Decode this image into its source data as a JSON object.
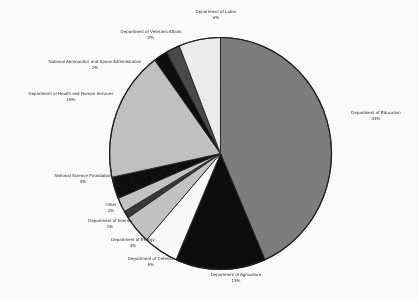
{
  "figure": {
    "kind": "pie-chart",
    "rendering": "grayscale scanned document"
  },
  "chart_data": {
    "type": "pie",
    "title": "",
    "subtitle": "",
    "xlabel": "",
    "ylabel": "",
    "grid": false,
    "legend_position": "none",
    "labels_outside": true,
    "label_format": "name + percent",
    "start_angle_deg": 0,
    "direction": "clockwise",
    "total_percent": 99,
    "categories": [
      "Department of Education",
      "Department of Agriculture",
      "Department of Defense",
      "Department of Energy",
      "Department of Interior",
      "Other",
      "National Science Foundation",
      "Department of Health and Human Services",
      "National Aeronautics and Space Administration",
      "Department of Veterans Affairs",
      "Department of Labor"
    ],
    "values": [
      43,
      13,
      5,
      4,
      1,
      2,
      3,
      18,
      2,
      2,
      6
    ],
    "value_labels": [
      "43%",
      "13%",
      "5%",
      "4%",
      "1%",
      "2%",
      "3%",
      "18%",
      "2%",
      "2%",
      "6%"
    ],
    "slice_colors": [
      "#808080",
      "#101010",
      "#ffffff",
      "#c8c8c8",
      "#3a3a3a",
      "#c8c8c8",
      "#121212",
      "#c6c6c6",
      "#101010",
      "#4a4a4a",
      "#f2f2f2"
    ],
    "slice_border_color": "#222222",
    "slices": [
      {
        "name": "Department of Education",
        "percent": 43,
        "percent_label": "43%",
        "color": "#808080"
      },
      {
        "name": "Department of Agriculture",
        "percent": 13,
        "percent_label": "13%",
        "color": "#101010"
      },
      {
        "name": "Department of Defense",
        "percent": 5,
        "percent_label": "5%",
        "color": "#ffffff"
      },
      {
        "name": "Department of Energy",
        "percent": 4,
        "percent_label": "4%",
        "color": "#c8c8c8"
      },
      {
        "name": "Department of Interior",
        "percent": 1,
        "percent_label": "1%",
        "color": "#3a3a3a"
      },
      {
        "name": "Other",
        "percent": 2,
        "percent_label": "2%",
        "color": "#c8c8c8"
      },
      {
        "name": "National Science Foundation",
        "percent": 3,
        "percent_label": "3%",
        "color": "#121212"
      },
      {
        "name": "Department of Health and Human Services",
        "percent": 18,
        "percent_label": "18%",
        "color": "#c6c6c6"
      },
      {
        "name": "National Aeronautics and Space Administration",
        "percent": 2,
        "percent_label": "2%",
        "color": "#101010"
      },
      {
        "name": "Department of Veterans Affairs",
        "percent": 2,
        "percent_label": "2%",
        "color": "#4a4a4a"
      },
      {
        "name": "Department of Labor",
        "percent": 6,
        "percent_label": "6%",
        "color": "#f2f2f2"
      }
    ]
  },
  "labels": {
    "education": {
      "name": "Department of Education",
      "pct": "43%"
    },
    "agriculture": {
      "name": "Department of Agriculture",
      "pct": "13%"
    },
    "defense": {
      "name": "Department of Defense",
      "pct": "5%"
    },
    "energy": {
      "name": "Department of Energy",
      "pct": "4%"
    },
    "interior": {
      "name": "Department of Interior",
      "pct": "1%"
    },
    "other": {
      "name": "Other",
      "pct": "2%"
    },
    "nsf": {
      "name": "National Science Foundation",
      "pct": "3%"
    },
    "hhs": {
      "name": "Department of Health and Human Services",
      "pct": "18%"
    },
    "nasa": {
      "name": "National Aeronautics and Space Administration",
      "pct": "2%"
    },
    "va": {
      "name": "Department of Veterans Affairs",
      "pct": "2%"
    },
    "labor": {
      "name": "Department of Labor",
      "pct": "6%"
    }
  }
}
